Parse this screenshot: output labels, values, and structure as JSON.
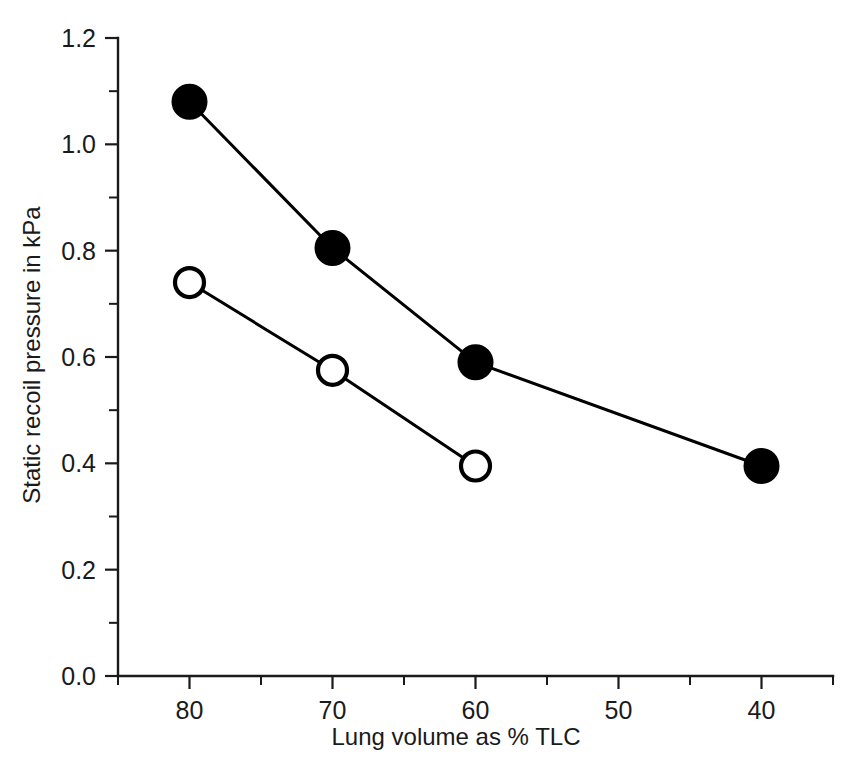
{
  "chart_data": {
    "type": "line",
    "title": "",
    "xlabel": "Lung volume as % TLC",
    "ylabel": "Static recoil pressure in kPa",
    "xlim": [
      85,
      35
    ],
    "ylim": [
      0.0,
      1.2
    ],
    "x_reversed": true,
    "grid": false,
    "legend_position": "none",
    "x_major_ticks": [
      80,
      70,
      60,
      50,
      40
    ],
    "x_major_tick_labels": [
      "80",
      "70",
      "60",
      "50",
      "40"
    ],
    "x_minor_ticks": [
      85,
      75,
      65,
      55,
      45,
      35
    ],
    "y_major_ticks": [
      0.0,
      0.2,
      0.4,
      0.6,
      0.8,
      1.0,
      1.2
    ],
    "y_major_tick_labels": [
      "0.0",
      "0.2",
      "0.4",
      "0.6",
      "0.8",
      "1.0",
      "1.2"
    ],
    "y_minor_ticks": [
      0.1,
      0.3,
      0.5,
      0.7,
      0.9,
      1.1
    ],
    "series": [
      {
        "name": "filled-circles",
        "marker": "filled-circle",
        "color": "#000000",
        "x": [
          80,
          70,
          60,
          40
        ],
        "values": [
          1.08,
          0.805,
          0.59,
          0.395
        ]
      },
      {
        "name": "open-circles",
        "marker": "open-circle",
        "color": "#000000",
        "x": [
          80,
          70,
          60
        ],
        "values": [
          0.74,
          0.575,
          0.395
        ]
      }
    ]
  },
  "axes": {
    "y_title": "Static recoil pressure in kPa",
    "x_title": "Lung volume as % TLC"
  }
}
